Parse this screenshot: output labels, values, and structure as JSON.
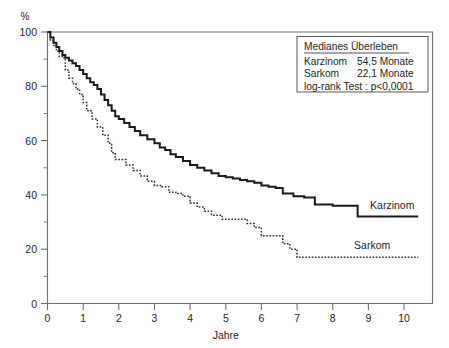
{
  "chart_data": {
    "type": "line",
    "title": "",
    "xlabel": "Jahre",
    "ylabel": "%",
    "xlim": [
      0,
      10.8
    ],
    "ylim": [
      0,
      100
    ],
    "xticks": [
      "0",
      "1",
      "2",
      "3",
      "4",
      "5",
      "6",
      "7",
      "8",
      "9",
      "10"
    ],
    "yticks": [
      "0",
      "20",
      "40",
      "60",
      "80",
      "100"
    ],
    "yminor_step": 10,
    "grid": false,
    "legend_position": "top-right",
    "series": [
      {
        "name": "Karzinom",
        "style": "solid",
        "median_survival_months": "54,5",
        "x": [
          0,
          0.08,
          0.17,
          0.25,
          0.33,
          0.42,
          0.5,
          0.6,
          0.7,
          0.8,
          0.9,
          1.0,
          1.1,
          1.2,
          1.3,
          1.4,
          1.5,
          1.6,
          1.7,
          1.8,
          1.9,
          2.0,
          2.15,
          2.3,
          2.45,
          2.6,
          2.8,
          3.0,
          3.15,
          3.3,
          3.45,
          3.6,
          3.8,
          4.0,
          4.2,
          4.4,
          4.6,
          4.8,
          5.0,
          5.2,
          5.4,
          5.6,
          5.8,
          6.0,
          6.2,
          6.4,
          6.6,
          6.9,
          7.2,
          7.5,
          8.0,
          8.4,
          8.7,
          9.4,
          10.4
        ],
        "y": [
          100,
          98,
          96,
          94.5,
          93,
          91.5,
          90.5,
          89.5,
          88.5,
          87.5,
          86,
          84.5,
          83,
          81.5,
          80.5,
          79,
          77,
          75,
          73,
          71,
          69,
          68,
          66.5,
          65,
          63.5,
          62,
          60.5,
          59,
          57.5,
          56.5,
          55,
          54,
          52.5,
          51,
          50,
          49,
          48,
          47,
          46.5,
          46,
          45.5,
          45,
          44.5,
          43.5,
          43,
          42.5,
          40.5,
          39.5,
          39,
          36.5,
          36,
          36,
          32,
          32,
          32
        ]
      },
      {
        "name": "Sarkom",
        "style": "dotted",
        "median_survival_months": "22,1",
        "x": [
          0,
          0.08,
          0.17,
          0.25,
          0.33,
          0.42,
          0.5,
          0.6,
          0.7,
          0.8,
          0.9,
          1.0,
          1.1,
          1.25,
          1.4,
          1.55,
          1.7,
          1.8,
          1.9,
          2.0,
          2.2,
          2.4,
          2.6,
          2.8,
          3.0,
          3.2,
          3.4,
          3.6,
          3.8,
          4.0,
          4.2,
          4.4,
          4.6,
          4.9,
          5.2,
          5.4,
          5.6,
          5.8,
          6.0,
          6.2,
          6.4,
          6.6,
          6.8,
          7.0,
          7.6,
          8.4,
          9.4,
          10.4
        ],
        "y": [
          100,
          97,
          95,
          93,
          91,
          90.5,
          86,
          83,
          81,
          79,
          77,
          74,
          71,
          68,
          65,
          62,
          59,
          55.5,
          53,
          53,
          51,
          49,
          47,
          45,
          43.5,
          43,
          41,
          40.5,
          39.5,
          37,
          35.5,
          34,
          32.5,
          31,
          31,
          31,
          29.5,
          28,
          25,
          25,
          25,
          22,
          20,
          17,
          17,
          17,
          17,
          17
        ]
      }
    ],
    "annotations": [
      {
        "name": "karzinom-curve-label",
        "text": "Karzinom",
        "x": 9.05,
        "y": 36
      },
      {
        "name": "sarkom-curve-label",
        "text": "Sarkom",
        "x": 8.6,
        "y": 21.5
      }
    ]
  },
  "legend": {
    "title": "Medianes Überleben",
    "rows": [
      {
        "label": "Karzinom",
        "value": "54,5 Monate"
      },
      {
        "label": "Sarkom",
        "value": "22,1 Monate"
      }
    ],
    "stat": "log-rank Test : p<0,0001"
  }
}
